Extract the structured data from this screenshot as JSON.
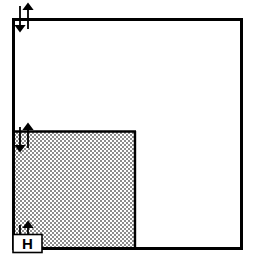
{
  "figure": {
    "background_color": "#ffffff",
    "stroke_color": "#000000",
    "width": 257,
    "height": 263
  },
  "outer_square": {
    "name": "outer-square",
    "x": 12,
    "y": 18,
    "width": 231,
    "height": 232,
    "stroke_color": "#000000",
    "stroke_width": 3,
    "fill_color": "#ffffff"
  },
  "inner_square": {
    "name": "inner-shaded-square",
    "x": 12,
    "y": 131,
    "width": 124,
    "height": 119,
    "stroke_color": "#000000",
    "stroke_width": 2,
    "fill_pattern": "checkerboard-dither-50",
    "fill_color": "#b0b0b0"
  },
  "h_label": {
    "name": "h-label-box",
    "text": "H",
    "x": 12,
    "y": 234,
    "width": 30,
    "height": 19,
    "box_fill": "#ffffff",
    "box_stroke": "#000000",
    "text_color": "#000000"
  },
  "markers": [
    {
      "name": "level-marker-top",
      "down_arrow_x": 20,
      "up_arrow_x": 28,
      "top": 5,
      "bottom": 30,
      "color": "#000000"
    },
    {
      "name": "level-marker-middle",
      "down_arrow_x": 20,
      "up_arrow_x": 28,
      "top": 126,
      "bottom": 150,
      "color": "#000000"
    },
    {
      "name": "level-marker-bottom",
      "down_arrow_x": 20,
      "up_arrow_x": 28,
      "top": 224,
      "bottom": 240,
      "color": "#000000"
    }
  ]
}
